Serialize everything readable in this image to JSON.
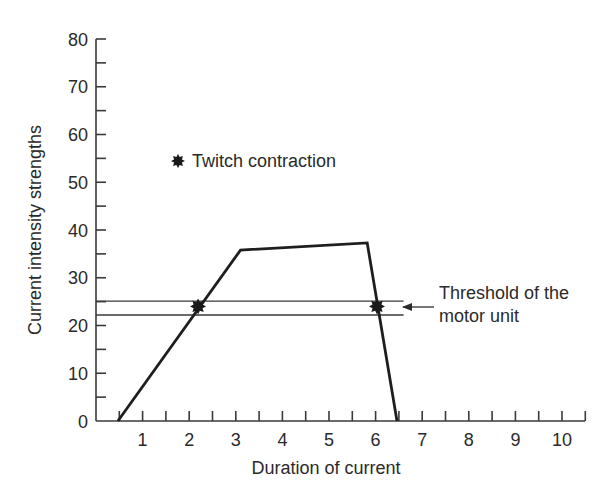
{
  "chart_data": {
    "type": "line",
    "title": "",
    "xlabel": "Duration of current",
    "ylabel": "Current intensity strengths",
    "xlim": [
      0,
      10.5
    ],
    "ylim": [
      0,
      80
    ],
    "x_ticks": [
      1,
      2,
      3,
      4,
      5,
      6,
      7,
      8,
      9,
      10
    ],
    "x_minor_ticks": [
      0.5,
      1.5,
      2.5,
      3.5,
      4.5,
      5.5,
      6.5,
      7.5,
      8.5,
      9.5,
      10.5
    ],
    "y_ticks": [
      0,
      10,
      20,
      30,
      40,
      50,
      60,
      70,
      80
    ],
    "y_minor_ticks": [
      5,
      15,
      25,
      35,
      45,
      55,
      65,
      75
    ],
    "grid": false,
    "series": [
      {
        "name": "Current pulse",
        "x": [
          0.47,
          3.1,
          5.82,
          6.46
        ],
        "y": [
          0,
          35.8,
          37.3,
          0
        ]
      }
    ],
    "threshold_lines": [
      {
        "y": 25.1,
        "x_start": 0,
        "x_end": 6.6
      },
      {
        "y": 22.2,
        "x_start": 0,
        "x_end": 6.6
      }
    ],
    "markers": [
      {
        "label": "Twitch contraction",
        "symbol": "star",
        "x": 2.19,
        "y": 24.0
      },
      {
        "label": "Twitch contraction",
        "symbol": "star",
        "x": 6.03,
        "y": 24.0
      }
    ],
    "legend": {
      "entries": [
        {
          "symbol": "star",
          "label": "Twitch contraction"
        }
      ],
      "position": "inside upper left"
    },
    "annotations": [
      {
        "text_lines": [
          "Threshold of the",
          "motor unit"
        ],
        "arrow_to": {
          "x": 6.6,
          "y": 23.8
        }
      }
    ]
  }
}
